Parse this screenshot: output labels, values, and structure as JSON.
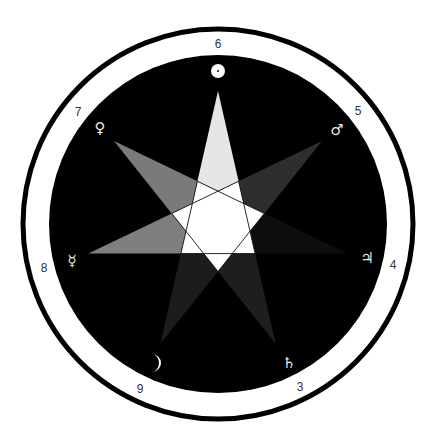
{
  "diagram": {
    "center": [
      218,
      224
    ],
    "outer_ring_radius": 195,
    "outer_ring_stroke": 5,
    "disk_radius": 169,
    "star_radius": 133,
    "star_type": "{7/3} heptagram",
    "colors": {
      "background": "#ffffff",
      "ring": "#000000",
      "disk": "#000000",
      "center": "#ffffff",
      "edge": "#111111",
      "glyph": "#e8e8e8",
      "label": "#333333"
    },
    "points": [
      {
        "planet": "Sun",
        "glyph": "sun-icon",
        "symbol": "☉",
        "number": "6",
        "arm_color": "#e6e6e6",
        "glyph_pos": [
          218,
          71
        ],
        "label_pos": [
          218,
          44
        ]
      },
      {
        "planet": "Mars",
        "glyph": "mars-icon",
        "symbol": "♂",
        "number": "5",
        "arm_color": "#2e2e2e",
        "glyph_pos": [
          337,
          130
        ],
        "label_pos": [
          358,
          111
        ]
      },
      {
        "planet": "Jupiter",
        "glyph": "jupiter-icon",
        "symbol": "♃",
        "number": "4",
        "arm_color": "#0e0e0e",
        "glyph_pos": [
          367,
          258
        ],
        "label_pos": [
          393,
          265
        ]
      },
      {
        "planet": "Saturn",
        "glyph": "saturn-icon",
        "symbol": "♄",
        "number": "3",
        "arm_color": "#1e1e1e",
        "glyph_pos": [
          289,
          363
        ],
        "label_pos": [
          300,
          387
        ]
      },
      {
        "planet": "Moon",
        "glyph": "moon-icon",
        "symbol": "☽",
        "number": "9",
        "arm_color": "#1c1c1c",
        "glyph_pos": [
          154,
          363
        ],
        "label_pos": [
          140,
          389
        ]
      },
      {
        "planet": "Mercury",
        "glyph": "mercury-icon",
        "symbol": "☿",
        "number": "8",
        "arm_color": "#7e7e7e",
        "glyph_pos": [
          72,
          261
        ],
        "label_pos": [
          44,
          268
        ]
      },
      {
        "planet": "Venus",
        "glyph": "venus-icon",
        "symbol": "♀",
        "number": "7",
        "arm_color": "#7a7a7a",
        "glyph_pos": [
          100,
          128
        ],
        "label_pos": [
          78,
          112
        ]
      }
    ]
  }
}
